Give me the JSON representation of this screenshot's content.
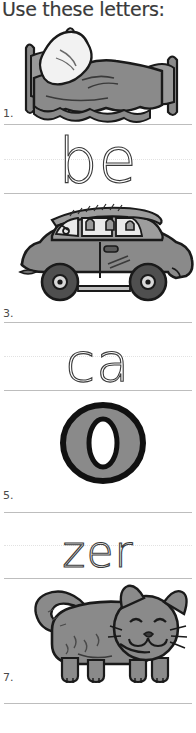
{
  "page": {
    "title": "Use these letters:",
    "background_color": "#ffffff",
    "rule_line_color": "#bdbdbd",
    "dotted_midline_color": "#e2e2e2",
    "art_fill_color": "#8a8a8a",
    "art_outline_color": "#1a1a1a",
    "art_highlight_color": "#ffffff"
  },
  "items": [
    {
      "number": "1.",
      "picture": "bed-illustration",
      "answer_text": "be"
    },
    {
      "number": "3.",
      "picture": "car-illustration",
      "answer_text": "ca"
    },
    {
      "number": "5.",
      "picture": "letter-o-illustration",
      "answer_text": "zer"
    },
    {
      "number": "7.",
      "picture": "cat-illustration",
      "answer_text": ""
    }
  ]
}
